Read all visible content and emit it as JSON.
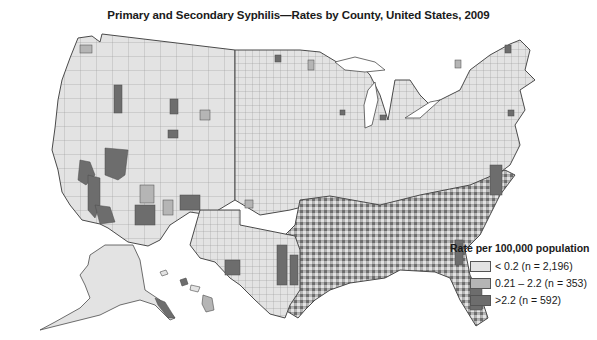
{
  "title": "Primary and Secondary Syphilis—Rates by County, United States, 2009",
  "colors": {
    "low": "#e3e3e3",
    "mid": "#b5b5b5",
    "high": "#6d6d6d",
    "border": "#4a4a4a",
    "county_line": "#8a8a8a"
  },
  "legend": {
    "title": "Rate per 100,000 population",
    "items": [
      {
        "label": "< 0.2 (n = 2,196)",
        "class": "low"
      },
      {
        "label": "0.21 – 2.2 (n = 353)",
        "class": "mid"
      },
      {
        "label": ">2.2 (n = 592)",
        "class": "high"
      }
    ]
  },
  "map": {
    "regions_shown": [
      "Contiguous United States",
      "Alaska",
      "Hawaii"
    ],
    "high_rate_areas": [
      "Southeast",
      "California",
      "Arizona",
      "New Mexico",
      "Texas (east)",
      "Louisiana",
      "Mississippi",
      "Alabama",
      "Georgia",
      "South Carolina",
      "Florida"
    ]
  }
}
